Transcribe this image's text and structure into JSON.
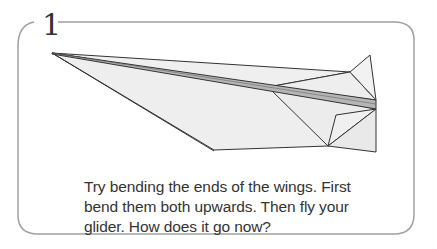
{
  "step": {
    "number": "1",
    "instruction": "Try bending the ends of the wings. First bend them both upwards. Then fly your glider. How does it go now?"
  },
  "illustration": {
    "subject": "paper-glider",
    "colors": {
      "paper": "#eeeeee",
      "fold_bar": "#b5b5b5",
      "outline": "#333333",
      "frame": "#a0a0a0"
    }
  }
}
